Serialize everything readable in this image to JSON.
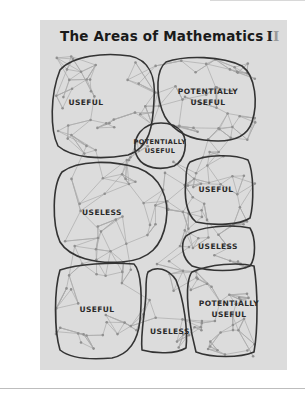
{
  "comic": {
    "title": "The Areas of Mathematics",
    "numeral_dark": "I",
    "numeral_light": "I",
    "colors": {
      "panel": "#dcdcdc",
      "outline": "#333333",
      "network_line": "#aaaaaa",
      "network_node": "#8f8f8f"
    },
    "regions": [
      {
        "id": "top-left",
        "label_lines": [
          "USEFUL"
        ],
        "x": 86,
        "y": 103
      },
      {
        "id": "top-right",
        "label_lines": [
          "POTENTIALLY",
          "USEFUL"
        ],
        "x": 208,
        "y": 98
      },
      {
        "id": "center-small",
        "label_lines": [
          "POTENTIALLY",
          "USEFUL"
        ],
        "x": 160,
        "y": 147
      },
      {
        "id": "middle-left",
        "label_lines": [
          "USELESS"
        ],
        "x": 102,
        "y": 213
      },
      {
        "id": "middle-right",
        "label_lines": [
          "USEFUL"
        ],
        "x": 216,
        "y": 190
      },
      {
        "id": "right-lower",
        "label_lines": [
          "USELESS"
        ],
        "x": 218,
        "y": 247
      },
      {
        "id": "bottom-left",
        "label_lines": [
          "USEFUL"
        ],
        "x": 97,
        "y": 310
      },
      {
        "id": "bottom-center",
        "label_lines": [
          "USELESS"
        ],
        "x": 170,
        "y": 332
      },
      {
        "id": "bottom-right",
        "label_lines": [
          "POTENTIALLY",
          "USEFUL"
        ],
        "x": 229,
        "y": 310
      }
    ]
  }
}
